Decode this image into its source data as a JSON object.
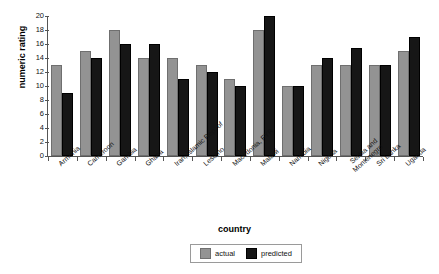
{
  "chart_data": {
    "type": "bar",
    "title": "",
    "xlabel": "country",
    "ylabel": "numeric rating",
    "ylim": [
      0,
      20
    ],
    "yticks": [
      0,
      2,
      4,
      6,
      8,
      10,
      12,
      14,
      16,
      18,
      20
    ],
    "grid": false,
    "legend_position": "bottom-center",
    "categories": [
      "Armenia",
      "Cameroon",
      "Gambia",
      "Ghana",
      "Iran, Islamic Rep. of",
      "Lesotho",
      "Macedonia, FYR",
      "Malawi",
      "Namibia",
      "Nigeria",
      "Serbia and Montenegro",
      "Sri Lanka",
      "Uganda"
    ],
    "series": [
      {
        "name": "actual",
        "color": "#939393",
        "values": [
          13,
          15,
          18,
          14,
          14,
          13,
          11,
          18,
          10,
          13,
          13,
          13,
          15
        ]
      },
      {
        "name": "predicted",
        "color": "#161616",
        "values": [
          9,
          14,
          16,
          16,
          11,
          12,
          10,
          20,
          10,
          14,
          15.5,
          13,
          17
        ]
      }
    ]
  },
  "legend": {
    "items": [
      {
        "label": "actual",
        "color": "#939393"
      },
      {
        "label": "predicted",
        "color": "#161616"
      }
    ]
  }
}
